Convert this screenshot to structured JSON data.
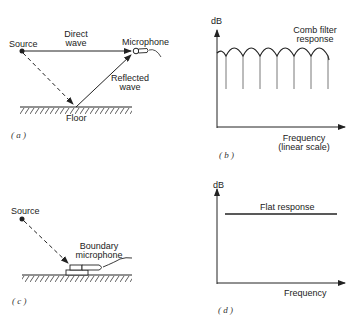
{
  "panels": {
    "a": {
      "caption": "( a )",
      "source_label": "Source",
      "microphone_label": "Microphone",
      "direct_wave_label_1": "Direct",
      "direct_wave_label_2": "wave",
      "reflected_wave_label_1": "Reflected",
      "reflected_wave_label_2": "wave",
      "floor_label": "Floor"
    },
    "b": {
      "caption": "( b )",
      "y_axis_label": "dB",
      "curve_label_1": "Comb  filter",
      "curve_label_2": "response",
      "x_axis_label_1": "Frequency",
      "x_axis_label_2": "(linear  scale)"
    },
    "c": {
      "caption": "( c )",
      "source_label": "Source",
      "mic_label_1": "Boundary",
      "mic_label_2": "microphone"
    },
    "d": {
      "caption": "( d )",
      "y_axis_label": "dB",
      "curve_label": "Flat  response",
      "x_axis_label": "Frequency"
    }
  },
  "colors": {
    "ink": "#222222",
    "background": "#ffffff"
  }
}
